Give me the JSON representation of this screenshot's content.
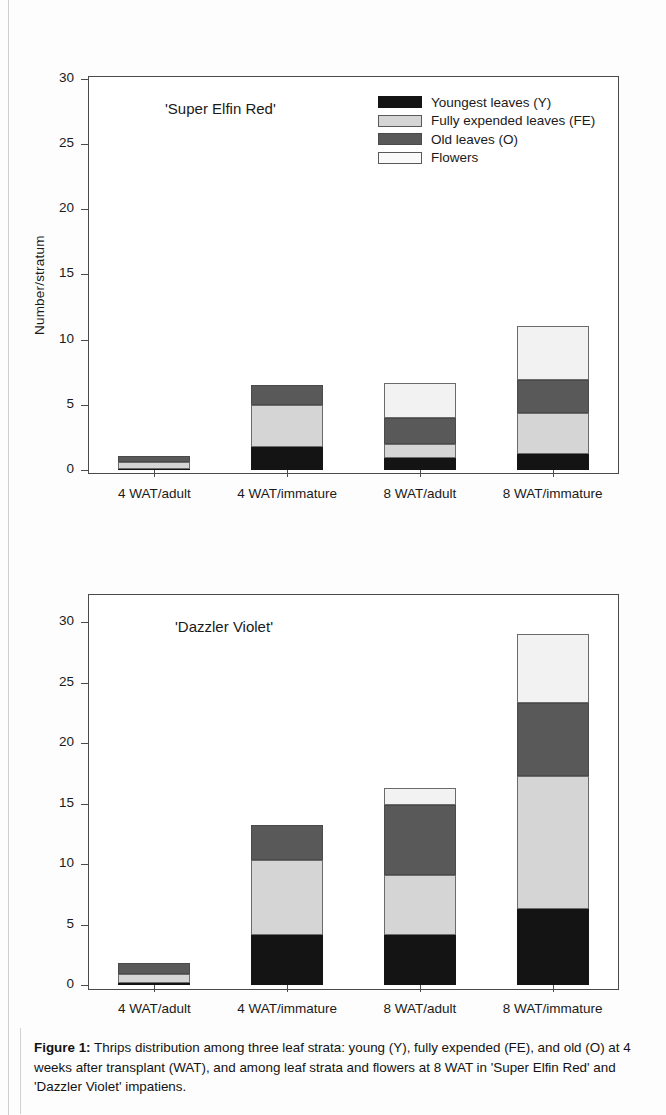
{
  "figure": {
    "caption_label": "Figure 1:",
    "caption_text": " Thrips distribution among three leaf strata: young (Y), fully expended (FE), and old (O) at 4 weeks after transplant (WAT), and among leaf strata and flowers at 8 WAT in 'Super Elfin Red' and 'Dazzler Violet' impatiens."
  },
  "legend": {
    "position": "top-right-inside-panel-1",
    "entries": [
      {
        "key": "y",
        "label": "Youngest leaves (Y)",
        "color": "#141414"
      },
      {
        "key": "fe",
        "label": "Fully expended leaves (FE)",
        "color": "#d5d5d5"
      },
      {
        "key": "o",
        "label": "Old leaves (O)",
        "color": "#595959"
      },
      {
        "key": "fl",
        "label": "Flowers",
        "color": "#fafafa"
      }
    ]
  },
  "chart_data": [
    {
      "id": "panel-super-elfin-red",
      "type": "bar",
      "stacked": true,
      "title": "'Super Elfin Red'",
      "xlabel": "",
      "ylabel": "Number/stratum",
      "ylim": [
        0,
        32
      ],
      "yticks": [
        0,
        5,
        10,
        15,
        20,
        25,
        30
      ],
      "ytick_labels": [
        "0",
        "5",
        "10",
        "15",
        "20",
        "25",
        "30"
      ],
      "grid": false,
      "categories": [
        "4 WAT/adult",
        "4 WAT/immature",
        "8 WAT/adult",
        "8 WAT/immature"
      ],
      "series": [
        {
          "name": "Youngest leaves (Y)",
          "key": "y",
          "values": [
            0.1,
            1.8,
            0.9,
            1.2
          ]
        },
        {
          "name": "Fully expended leaves (FE)",
          "key": "fe",
          "values": [
            0.5,
            3.2,
            1.1,
            3.2
          ]
        },
        {
          "name": "Old leaves (O)",
          "key": "o",
          "values": [
            0.5,
            1.5,
            2.0,
            2.5
          ]
        },
        {
          "name": "Flowers",
          "key": "fl",
          "values": [
            0.0,
            0.0,
            2.7,
            4.1
          ]
        }
      ],
      "totals": [
        1.1,
        6.5,
        6.7,
        11.0
      ]
    },
    {
      "id": "panel-dazzler-violet",
      "type": "bar",
      "stacked": true,
      "title": "'Dazzler Violet'",
      "xlabel": "",
      "ylabel": "",
      "ylim": [
        0,
        32
      ],
      "yticks": [
        0,
        5,
        10,
        15,
        20,
        25,
        30
      ],
      "ytick_labels": [
        "0",
        "5",
        "10",
        "15",
        "20",
        "25",
        "30"
      ],
      "grid": false,
      "categories": [
        "4 WAT/adult",
        "4 WAT/immature",
        "8 WAT/adult",
        "8 WAT/immature"
      ],
      "series": [
        {
          "name": "Youngest leaves (Y)",
          "key": "y",
          "values": [
            0.2,
            4.1,
            4.1,
            6.3
          ]
        },
        {
          "name": "Fully expended leaves (FE)",
          "key": "fe",
          "values": [
            0.7,
            6.2,
            5.0,
            11.0
          ]
        },
        {
          "name": "Old leaves (O)",
          "key": "o",
          "values": [
            0.9,
            2.9,
            5.8,
            6.0
          ]
        },
        {
          "name": "Flowers",
          "key": "fl",
          "values": [
            0.0,
            0.0,
            1.4,
            5.7
          ]
        }
      ],
      "totals": [
        1.8,
        13.2,
        16.3,
        29.0
      ]
    }
  ]
}
